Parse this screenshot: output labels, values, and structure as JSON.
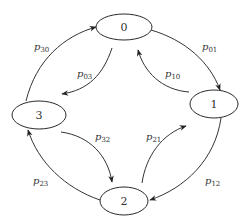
{
  "diagram": {
    "type": "state-transition",
    "nodes": [
      {
        "id": "0",
        "label": "0"
      },
      {
        "id": "1",
        "label": "1"
      },
      {
        "id": "2",
        "label": "2"
      },
      {
        "id": "3",
        "label": "3"
      }
    ],
    "edges": [
      {
        "from": "0",
        "to": "1",
        "label": "p",
        "sub": "01"
      },
      {
        "from": "1",
        "to": "0",
        "label": "p",
        "sub": "10"
      },
      {
        "from": "0",
        "to": "3",
        "label": "p",
        "sub": "03"
      },
      {
        "from": "3",
        "to": "0",
        "label": "p",
        "sub": "30"
      },
      {
        "from": "1",
        "to": "2",
        "label": "p",
        "sub": "12"
      },
      {
        "from": "2",
        "to": "1",
        "label": "p",
        "sub": "21"
      },
      {
        "from": "3",
        "to": "2",
        "label": "p",
        "sub": "32"
      },
      {
        "from": "2",
        "to": "3",
        "label": "p",
        "sub": "23"
      }
    ]
  }
}
